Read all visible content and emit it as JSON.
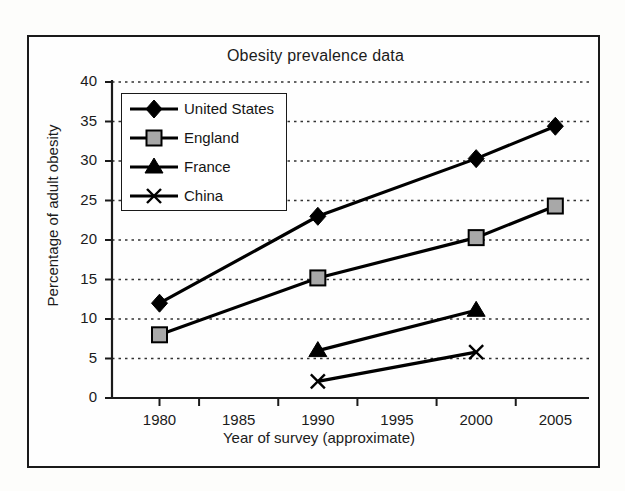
{
  "figure": {
    "title": "Obesity prevalence data"
  },
  "chart_data": {
    "type": "line",
    "title": "Obesity prevalence data",
    "xlabel": "Year of survey (approximate)",
    "ylabel": "Percentage of adult obesity",
    "xlim": [
      1977,
      2007
    ],
    "ylim": [
      0,
      40
    ],
    "xticks": [
      1980,
      1985,
      1990,
      1995,
      2000,
      2005
    ],
    "yticks": [
      0,
      5,
      10,
      15,
      20,
      25,
      30,
      35,
      40
    ],
    "xtick_labels": [
      "1980",
      "1985",
      "1990",
      "1995",
      "2000",
      "2005"
    ],
    "ytick_labels": [
      "0",
      "5",
      "10",
      "15",
      "20",
      "25",
      "30",
      "35",
      "40"
    ],
    "grid": "horizontal-dotted",
    "legend_position": "upper-left-inside",
    "series": [
      {
        "name": "United States",
        "marker": "filled-diamond",
        "color": "#000000",
        "x": [
          1980,
          1990,
          2000,
          2005
        ],
        "values": [
          12.0,
          23.0,
          30.3,
          34.4
        ]
      },
      {
        "name": "England",
        "marker": "gray-square",
        "color": "#a8a8a8",
        "x": [
          1980,
          1990,
          2000,
          2005
        ],
        "values": [
          8.0,
          15.2,
          20.3,
          24.3
        ]
      },
      {
        "name": "France",
        "marker": "filled-triangle",
        "color": "#000000",
        "x": [
          1990,
          2000
        ],
        "values": [
          6.0,
          11.1
        ]
      },
      {
        "name": "China",
        "marker": "cross-x",
        "color": "#000000",
        "x": [
          1990,
          2000
        ],
        "values": [
          2.1,
          5.8
        ]
      }
    ]
  },
  "legend": {
    "items": [
      {
        "label": "United States",
        "marker": "filled-diamond"
      },
      {
        "label": "England",
        "marker": "gray-square"
      },
      {
        "label": "France",
        "marker": "filled-triangle"
      },
      {
        "label": "China",
        "marker": "cross-x"
      }
    ]
  },
  "colors": {
    "line": "#000000",
    "england_marker_fill": "#a8a8a8",
    "axis": "#1a1a1a",
    "grid": "#333333",
    "background": "#fdfdfb"
  }
}
